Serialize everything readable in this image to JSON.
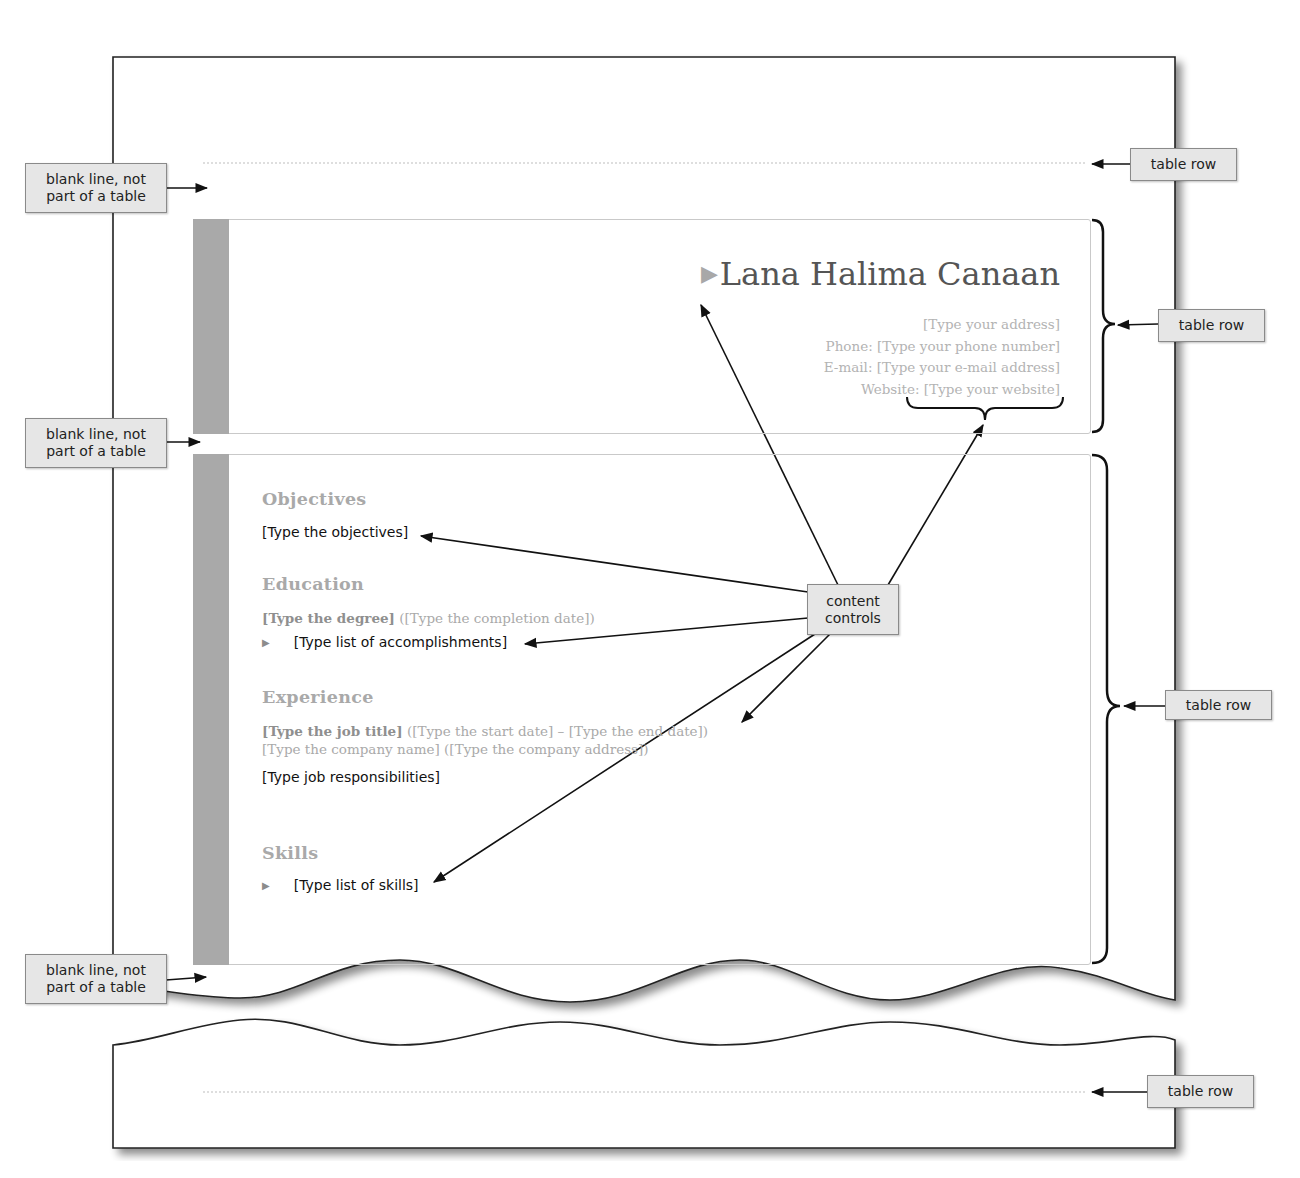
{
  "callouts": {
    "blank_line_1": "blank line, not part of a table",
    "blank_line_2": "blank line, not part of a table",
    "blank_line_3": "blank line, not part of a table",
    "table_row_1": "table row",
    "table_row_2": "table row",
    "table_row_3": "table row",
    "table_row_4": "table row",
    "content_controls": "content controls"
  },
  "resume": {
    "header": {
      "name": "Lana Halima Canaan",
      "address": "[Type your address]",
      "phone": "Phone: [Type your phone number]",
      "email": "E-mail: [Type your e-mail address]",
      "website_label": "Website: ",
      "website_value": "[Type your website]"
    },
    "sections": {
      "objectives": {
        "heading": "Objectives",
        "text": "[Type the objectives]"
      },
      "education": {
        "heading": "Education",
        "degree": "[Type the degree]",
        "completion_date": " ([Type the completion date])",
        "accomplishments": "[Type list of accomplishments]"
      },
      "experience": {
        "heading": "Experience",
        "job_title": "[Type the job title]",
        "dates": " ([Type the start date] – [Type the end date])",
        "company": "[Type the company name] ([Type the company address])",
        "responsibilities": "[Type job responsibilities]"
      },
      "skills": {
        "heading": "Skills",
        "text": "[Type list of skills]"
      }
    }
  },
  "colors": {
    "side_bar": "#a9a9a9",
    "heading_gray": "#a9a9a9",
    "placeholder_gray": "#b3b3b3",
    "callout_fill": "#e6e6e6"
  }
}
